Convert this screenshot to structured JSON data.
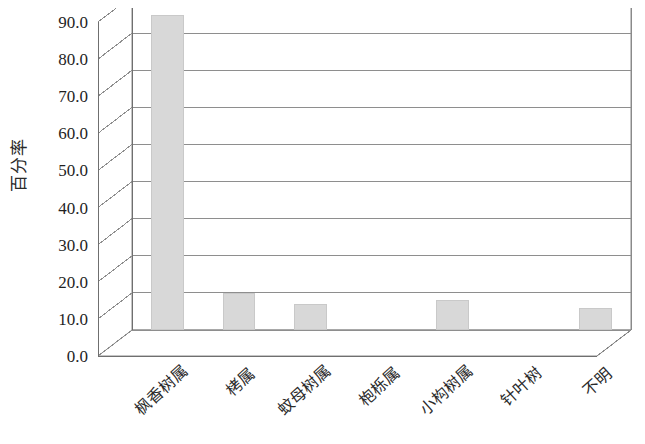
{
  "chart_data": {
    "type": "bar",
    "title": "",
    "xlabel": "",
    "ylabel": "百分率",
    "ylim": [
      0.0,
      90.0
    ],
    "ytick_step": 10.0,
    "grid": true,
    "legend": "none",
    "style": "3d-column",
    "categories": [
      "枫香树属",
      "栲属",
      "蚊母树属",
      "枹栎属",
      "小构树属",
      "针叶树",
      "不明"
    ],
    "values": [
      85.0,
      10.0,
      7.0,
      0.0,
      8.0,
      0.0,
      6.0
    ],
    "ytick_labels": [
      "90.0",
      "80.0",
      "70.0",
      "60.0",
      "50.0",
      "40.0",
      "30.0",
      "20.0",
      "10.0",
      "0.0"
    ],
    "ytick_values": [
      90.0,
      80.0,
      70.0,
      60.0,
      50.0,
      40.0,
      30.0,
      20.0,
      10.0,
      0.0
    ],
    "bar_fill_color": "#d8d8d8",
    "bar_border_color": "#c9c9c9",
    "axis_color": "#6f6f6f",
    "text_color": "#2a2a2a"
  }
}
